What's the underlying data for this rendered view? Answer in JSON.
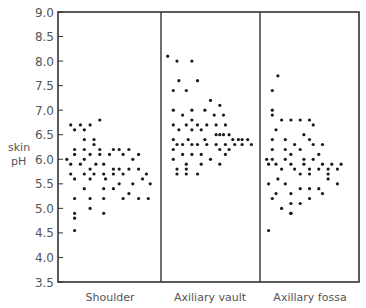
{
  "chart_data": {
    "type": "scatter",
    "title": "",
    "xlabel": "",
    "ylabel": "skin pH",
    "ylabel_lines": [
      "skin",
      "pH"
    ],
    "ylim": [
      3.5,
      9.0
    ],
    "yticks": [
      3.5,
      4.0,
      4.5,
      5.0,
      5.5,
      6.0,
      6.5,
      7.0,
      7.5,
      8.0,
      8.5,
      9.0
    ],
    "ytick_labels": [
      "3.5",
      "4.0",
      "4.5",
      "5.0",
      "5.5",
      "6.0",
      "6.5",
      "7.0",
      "7.5",
      "8.0",
      "8.5",
      "9.0"
    ],
    "grid": false,
    "legend": null,
    "categories": [
      "Shoulder",
      "Axiliary vault",
      "Axillary fossa"
    ],
    "panel_note": "Each category is a separate panel; dots are individual skin pH measurements jittered horizontally. Points given as [relative_x_in_panel (0-1), pH].",
    "series": [
      {
        "name": "Shoulder",
        "points": [
          [
            0.1,
            6.7
          ],
          [
            0.2,
            6.7
          ],
          [
            0.3,
            6.7
          ],
          [
            0.4,
            6.8
          ],
          [
            0.14,
            6.6
          ],
          [
            0.24,
            6.6
          ],
          [
            0.24,
            6.4
          ],
          [
            0.34,
            6.4
          ],
          [
            0.14,
            6.2
          ],
          [
            0.24,
            6.2
          ],
          [
            0.34,
            6.3
          ],
          [
            0.4,
            6.2
          ],
          [
            0.54,
            6.2
          ],
          [
            0.6,
            6.2
          ],
          [
            0.7,
            6.2
          ],
          [
            0.8,
            6.1
          ],
          [
            0.06,
            6.0
          ],
          [
            0.14,
            6.1
          ],
          [
            0.24,
            6.0
          ],
          [
            0.3,
            6.1
          ],
          [
            0.4,
            6.1
          ],
          [
            0.5,
            6.1
          ],
          [
            0.64,
            6.1
          ],
          [
            0.74,
            6.0
          ],
          [
            0.1,
            5.9
          ],
          [
            0.2,
            5.9
          ],
          [
            0.3,
            5.8
          ],
          [
            0.36,
            5.9
          ],
          [
            0.44,
            5.9
          ],
          [
            0.54,
            5.8
          ],
          [
            0.6,
            5.8
          ],
          [
            0.7,
            5.8
          ],
          [
            0.8,
            5.8
          ],
          [
            0.88,
            5.7
          ],
          [
            0.1,
            5.7
          ],
          [
            0.24,
            5.7
          ],
          [
            0.34,
            5.7
          ],
          [
            0.44,
            5.7
          ],
          [
            0.54,
            5.7
          ],
          [
            0.64,
            5.7
          ],
          [
            0.84,
            5.6
          ],
          [
            0.92,
            5.5
          ],
          [
            0.14,
            5.6
          ],
          [
            0.3,
            5.6
          ],
          [
            0.46,
            5.6
          ],
          [
            0.6,
            5.5
          ],
          [
            0.74,
            5.5
          ],
          [
            0.24,
            5.4
          ],
          [
            0.44,
            5.4
          ],
          [
            0.54,
            5.4
          ],
          [
            0.7,
            5.3
          ],
          [
            0.8,
            5.2
          ],
          [
            0.14,
            5.2
          ],
          [
            0.3,
            5.2
          ],
          [
            0.44,
            5.2
          ],
          [
            0.64,
            5.2
          ],
          [
            0.9,
            5.2
          ],
          [
            0.3,
            5.0
          ],
          [
            0.14,
            4.9
          ],
          [
            0.44,
            4.9
          ],
          [
            0.14,
            4.8
          ],
          [
            0.14,
            4.55
          ]
        ]
      },
      {
        "name": "Axiliary vault",
        "points": [
          [
            0.04,
            8.1
          ],
          [
            0.14,
            8.0
          ],
          [
            0.3,
            8.0
          ],
          [
            0.16,
            7.6
          ],
          [
            0.36,
            7.6
          ],
          [
            0.1,
            7.4
          ],
          [
            0.24,
            7.4
          ],
          [
            0.5,
            7.2
          ],
          [
            0.6,
            7.1
          ],
          [
            0.1,
            7.0
          ],
          [
            0.2,
            6.9
          ],
          [
            0.3,
            7.0
          ],
          [
            0.44,
            7.0
          ],
          [
            0.54,
            6.9
          ],
          [
            0.64,
            6.9
          ],
          [
            0.3,
            6.8
          ],
          [
            0.1,
            6.7
          ],
          [
            0.24,
            6.7
          ],
          [
            0.36,
            6.7
          ],
          [
            0.46,
            6.7
          ],
          [
            0.56,
            6.7
          ],
          [
            0.66,
            6.7
          ],
          [
            0.16,
            6.6
          ],
          [
            0.3,
            6.6
          ],
          [
            0.4,
            6.6
          ],
          [
            0.6,
            6.5
          ],
          [
            0.64,
            6.5
          ],
          [
            0.7,
            6.5
          ],
          [
            0.8,
            6.4
          ],
          [
            0.84,
            6.4
          ],
          [
            0.1,
            6.4
          ],
          [
            0.26,
            6.4
          ],
          [
            0.44,
            6.4
          ],
          [
            0.56,
            6.5
          ],
          [
            0.74,
            6.4
          ],
          [
            0.9,
            6.4
          ],
          [
            0.14,
            6.3
          ],
          [
            0.2,
            6.3
          ],
          [
            0.3,
            6.3
          ],
          [
            0.36,
            6.3
          ],
          [
            0.46,
            6.3
          ],
          [
            0.56,
            6.3
          ],
          [
            0.66,
            6.3
          ],
          [
            0.76,
            6.3
          ],
          [
            0.84,
            6.3
          ],
          [
            0.94,
            6.3
          ],
          [
            0.1,
            6.2
          ],
          [
            0.6,
            6.2
          ],
          [
            0.7,
            6.2
          ],
          [
            0.2,
            6.1
          ],
          [
            0.3,
            6.1
          ],
          [
            0.4,
            6.1
          ],
          [
            0.66,
            6.1
          ],
          [
            0.1,
            6.0
          ],
          [
            0.24,
            5.9
          ],
          [
            0.4,
            5.9
          ],
          [
            0.5,
            6.0
          ],
          [
            0.6,
            5.9
          ],
          [
            0.14,
            5.8
          ],
          [
            0.24,
            5.8
          ],
          [
            0.14,
            5.7
          ],
          [
            0.24,
            5.7
          ],
          [
            0.36,
            5.7
          ]
        ]
      },
      {
        "name": "Axillary fossa",
        "points": [
          [
            0.16,
            7.7
          ],
          [
            0.1,
            7.4
          ],
          [
            0.1,
            7.0
          ],
          [
            0.1,
            6.9
          ],
          [
            0.2,
            6.8
          ],
          [
            0.3,
            6.8
          ],
          [
            0.4,
            6.8
          ],
          [
            0.5,
            6.8
          ],
          [
            0.54,
            6.7
          ],
          [
            0.14,
            6.6
          ],
          [
            0.44,
            6.5
          ],
          [
            0.1,
            6.4
          ],
          [
            0.24,
            6.4
          ],
          [
            0.5,
            6.4
          ],
          [
            0.34,
            6.3
          ],
          [
            0.54,
            6.3
          ],
          [
            0.64,
            6.3
          ],
          [
            0.1,
            6.2
          ],
          [
            0.24,
            6.2
          ],
          [
            0.4,
            6.2
          ],
          [
            0.3,
            6.1
          ],
          [
            0.6,
            6.1
          ],
          [
            0.04,
            6.0
          ],
          [
            0.1,
            6.0
          ],
          [
            0.24,
            6.0
          ],
          [
            0.44,
            6.0
          ],
          [
            0.54,
            6.0
          ],
          [
            0.64,
            5.9
          ],
          [
            0.74,
            5.9
          ],
          [
            0.84,
            5.9
          ],
          [
            0.06,
            5.9
          ],
          [
            0.14,
            5.9
          ],
          [
            0.3,
            5.9
          ],
          [
            0.44,
            5.9
          ],
          [
            0.5,
            5.8
          ],
          [
            0.6,
            5.8
          ],
          [
            0.7,
            5.8
          ],
          [
            0.8,
            5.8
          ],
          [
            0.2,
            5.8
          ],
          [
            0.34,
            5.8
          ],
          [
            0.4,
            5.7
          ],
          [
            0.5,
            5.7
          ],
          [
            0.7,
            5.7
          ],
          [
            0.16,
            5.6
          ],
          [
            0.7,
            5.6
          ],
          [
            0.8,
            5.5
          ],
          [
            0.06,
            5.5
          ],
          [
            0.24,
            5.5
          ],
          [
            0.4,
            5.4
          ],
          [
            0.5,
            5.4
          ],
          [
            0.6,
            5.4
          ],
          [
            0.14,
            5.3
          ],
          [
            0.3,
            5.3
          ],
          [
            0.64,
            5.3
          ],
          [
            0.1,
            5.2
          ],
          [
            0.3,
            5.1
          ],
          [
            0.4,
            5.1
          ],
          [
            0.5,
            5.2
          ],
          [
            0.2,
            5.0
          ],
          [
            0.3,
            4.9
          ],
          [
            0.3,
            4.9
          ],
          [
            0.06,
            4.55
          ]
        ]
      }
    ],
    "layout": {
      "plot_left": 58,
      "plot_right": 359,
      "plot_top": 12,
      "plot_bottom": 282,
      "dividers_x": [
        161,
        260
      ]
    }
  },
  "colors": {
    "axis": "#333333",
    "dot": "#1a1a1a",
    "text": "#555555",
    "background": "#ffffff"
  }
}
